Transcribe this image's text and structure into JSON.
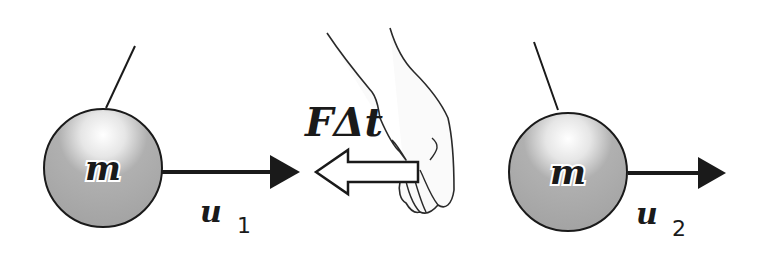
{
  "diagram": {
    "ball_left": {
      "label": "m",
      "velocity_label": "u",
      "velocity_subscript": "1"
    },
    "impulse": {
      "label": "FΔt"
    },
    "ball_right": {
      "label": "m",
      "velocity_label": "u",
      "velocity_subscript": "2"
    },
    "colors": {
      "ball": "#a9a9a9",
      "stroke": "#1a1a1a",
      "background": "#ffffff"
    }
  }
}
